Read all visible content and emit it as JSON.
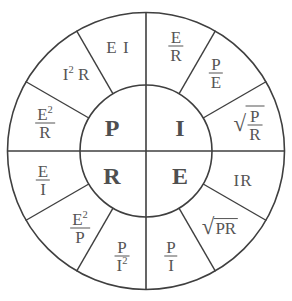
{
  "diagram": {
    "name": "ohms-law-pie-wheel",
    "colors": {
      "stroke": "#3f3f3f",
      "text": "#555555",
      "background": "#ffffff"
    },
    "geometry": {
      "center_x": 146,
      "center_y": 151,
      "outer_radius": 139,
      "inner_radius": 66,
      "quadrants": 4,
      "segments_per_quadrant": 3,
      "segment_degrees": 30
    }
  },
  "center": {
    "quadrants": [
      {
        "key": "power",
        "label": "P",
        "position": "top-left"
      },
      {
        "key": "current",
        "label": "I",
        "position": "top-right"
      },
      {
        "key": "resistance",
        "label": "R",
        "position": "bottom-left"
      },
      {
        "key": "voltage",
        "label": "E",
        "position": "bottom-right"
      }
    ]
  },
  "segments": [
    {
      "id": "p-ei",
      "quadrant": "P",
      "plain": "E I",
      "type": "inline",
      "parts": {
        "text": "E I"
      }
    },
    {
      "id": "p-i2r",
      "quadrant": "P",
      "plain": "I² R",
      "type": "inline",
      "parts": {
        "base": "I",
        "sup": "2",
        "tail": " R"
      }
    },
    {
      "id": "p-e2-r",
      "quadrant": "P",
      "plain": "E² / R",
      "type": "fraction",
      "parts": {
        "num": "E",
        "num_sup": "2",
        "den": "R"
      }
    },
    {
      "id": "i-e-r",
      "quadrant": "I",
      "plain": "E / R",
      "type": "fraction",
      "parts": {
        "num": "E",
        "den": "R"
      }
    },
    {
      "id": "i-p-e",
      "quadrant": "I",
      "plain": "P / E",
      "type": "fraction",
      "parts": {
        "num": "P",
        "den": "E"
      }
    },
    {
      "id": "i-sqrt-p-r",
      "quadrant": "I",
      "plain": "√(P / R)",
      "type": "radical-fraction",
      "parts": {
        "num": "P",
        "den": "R"
      }
    },
    {
      "id": "r-e-i",
      "quadrant": "R",
      "plain": "E / I",
      "type": "fraction",
      "parts": {
        "num": "E",
        "den": "I"
      }
    },
    {
      "id": "r-e2-p",
      "quadrant": "R",
      "plain": "E² / P",
      "type": "fraction",
      "parts": {
        "num": "E",
        "num_sup": "2",
        "den": "P"
      }
    },
    {
      "id": "r-p-i2",
      "quadrant": "R",
      "plain": "P / I²",
      "type": "fraction",
      "parts": {
        "num": "P",
        "den": "I",
        "den_sup": "2"
      }
    },
    {
      "id": "e-ir",
      "quadrant": "E",
      "plain": "IR",
      "type": "inline",
      "parts": {
        "text": "IR"
      }
    },
    {
      "id": "e-sqrt-pr",
      "quadrant": "E",
      "plain": "√(PR)",
      "type": "radical",
      "parts": {
        "text": "PR"
      }
    },
    {
      "id": "e-p-i",
      "quadrant": "E",
      "plain": "P / I",
      "type": "fraction",
      "parts": {
        "num": "P",
        "den": "I"
      }
    }
  ]
}
